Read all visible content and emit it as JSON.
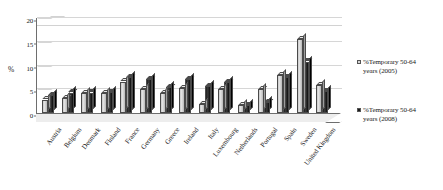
{
  "chart_data": {
    "type": "bar",
    "title": "",
    "subtitle": "",
    "xlabel": "",
    "ylabel": "%",
    "ylim": [
      0,
      20
    ],
    "yticks": [
      0,
      5,
      10,
      15,
      20
    ],
    "grid": true,
    "legend_position": "right",
    "style": "3d-clustered-column",
    "categories": [
      "Austria",
      "Belgium",
      "Denmark",
      "Finland",
      "France",
      "Germany",
      "Greece",
      "Ireland",
      "Italy",
      "Luxembourg",
      "Netherlands",
      "Portugal",
      "Spain",
      "Sweden",
      "United Kingdom"
    ],
    "series": [
      {
        "name": "%Temporary 50-64 years (2005)",
        "color": "#d0d0d0",
        "values": [
          2.8,
          3.2,
          4.2,
          4.2,
          6.6,
          5.0,
          4.2,
          5.2,
          1.9,
          5.0,
          1.6,
          5.0,
          8.0,
          15.5,
          5.8
        ]
      },
      {
        "name": "%Temporary 50-64 years (2008)",
        "color": "#1a1a1a",
        "values": [
          3.7,
          4.3,
          4.3,
          4.4,
          7.5,
          7.2,
          5.4,
          7.1,
          5.6,
          6.5,
          1.7,
          2.3,
          7.5,
          10.8,
          4.6
        ]
      }
    ]
  },
  "axis": {
    "y_label": "%",
    "tick_labels": [
      "20",
      "15",
      "10",
      "5",
      "0"
    ]
  },
  "legend": {
    "items": [
      {
        "label_line1": "%Temporary 50-64",
        "label_line2": "years (2005)",
        "swatch": "#d6d6d6"
      },
      {
        "label_line1": "%Temporary 50-64",
        "label_line2": "years (2008)",
        "swatch": "#1a1a1a"
      }
    ]
  }
}
